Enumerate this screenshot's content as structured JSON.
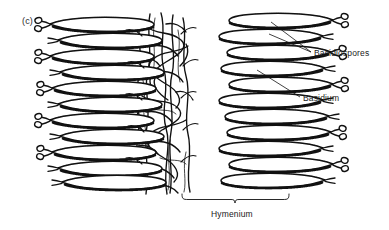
{
  "figure": {
    "panel_label": "(c)",
    "background_color": "#ffffff",
    "ink_color": "#111111"
  },
  "labels": {
    "basidiospores": "Basidiospores",
    "basidium": "Basidium",
    "hymenium": "Hymenium"
  },
  "annotations": {
    "leader_lines": [
      {
        "name": "basidiospores-leader-upper",
        "from_x": 271,
        "from_y": 22,
        "to_x": 311,
        "to_y": 52
      },
      {
        "name": "basidiospores-leader-lower",
        "from_x": 269,
        "from_y": 33,
        "to_x": 311,
        "to_y": 52
      },
      {
        "name": "basidium-leader",
        "from_x": 257,
        "from_y": 70,
        "to_x": 300,
        "to_y": 97
      }
    ],
    "bracket": {
      "name": "hymenium-bracket",
      "left_x": 182,
      "right_x": 289,
      "y": 198,
      "notch_x": 235
    }
  },
  "structure": {
    "left_basidia_rows": 10,
    "right_basidia_rows": 10,
    "trama_center_x": 160,
    "spore_knob_count_per_tip": 2
  }
}
